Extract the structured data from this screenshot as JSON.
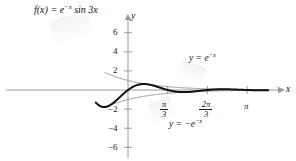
{
  "figure": {
    "width": 296,
    "height": 161,
    "background": "#ffffff",
    "curve_color": "#111111",
    "envelope_color": "#8c8c8c",
    "axis_color": "#9a9a9a"
  },
  "labels": {
    "function_label": "f(x) = e−x sin 3x",
    "function_label_parts": {
      "lhs": "f(x) = e",
      "exp": "−x",
      "rhs": " sin 3x"
    },
    "upper_envelope_parts": {
      "lhs": "y = e",
      "exp": "−x"
    },
    "lower_envelope_parts": {
      "lhs": "y = −e",
      "exp": "−x"
    },
    "x_axis_name": "x",
    "y_axis_name": "y"
  },
  "chart_data": {
    "type": "line",
    "title": "",
    "xlabel": "x",
    "ylabel": "y",
    "xlim": [
      -0.85,
      3.7
    ],
    "ylim": [
      -7.2,
      7.2
    ],
    "grid": false,
    "legend": "inline-annotations",
    "x_ticks": [
      {
        "value": 1.0471975512,
        "label": "π/3",
        "num": "π",
        "den": "3"
      },
      {
        "value": 2.0943951024,
        "label": "2π/3",
        "num": "2π",
        "den": "3"
      },
      {
        "value": 3.1415926536,
        "label": "π",
        "num": "π",
        "den": ""
      }
    ],
    "y_ticks": [
      {
        "value": 6,
        "label": "6"
      },
      {
        "value": 4,
        "label": "4"
      },
      {
        "value": 2,
        "label": "2"
      },
      {
        "value": -2,
        "label": "−2"
      },
      {
        "value": -4,
        "label": "−4"
      },
      {
        "value": -6,
        "label": "−6"
      }
    ],
    "series": [
      {
        "name": "f(x) = e^{-x} sin 3x",
        "color": "#111111",
        "width": 2.0,
        "formula": "exp(-x)*sin(3*x)",
        "domain": [
          -0.85,
          3.7
        ]
      },
      {
        "name": "y = e^{-x}",
        "color": "#8c8c8c",
        "width": 1.0,
        "formula": "exp(-x)",
        "domain": [
          -0.62,
          3.7
        ]
      },
      {
        "name": "y = -e^{-x}",
        "color": "#8c8c8c",
        "width": 1.0,
        "formula": "-exp(-x)",
        "domain": [
          -0.62,
          3.7
        ]
      }
    ],
    "annotations": [
      {
        "text": "f(x) = e^{-x} sin 3x",
        "x_px": 34,
        "y_px": 4
      },
      {
        "text": "y = e^{-x}",
        "x_px": 186,
        "y_px": 55
      },
      {
        "text": "y = -e^{-x}",
        "x_px": 168,
        "y_px": 121
      }
    ]
  }
}
